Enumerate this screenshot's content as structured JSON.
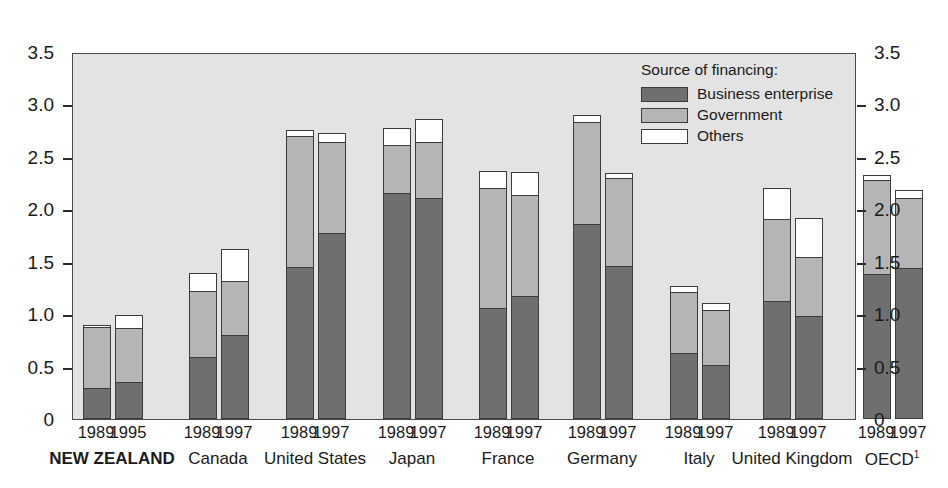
{
  "chart_data": {
    "type": "bar",
    "subtype": "stacked-grouped",
    "title": "",
    "xlabel": "",
    "ylabel": "",
    "ylim": [
      0,
      3.5
    ],
    "yticks": [
      0,
      0.5,
      1.0,
      1.5,
      2.0,
      2.5,
      3.0,
      3.5
    ],
    "ytick_labels": [
      "0",
      "0.5",
      "1.0",
      "1.5",
      "2.0",
      "2.5",
      "3.0",
      "3.5"
    ],
    "grid": false,
    "dual_axis": true,
    "legend": {
      "title": "Source of financing:",
      "position": "top-right-inside",
      "entries": [
        {
          "label": "Business enterprise",
          "key": "business",
          "color": "#6f6f6f"
        },
        {
          "label": "Government",
          "key": "government",
          "color": "#b5b5b5"
        },
        {
          "label": "Others",
          "key": "others",
          "color": "#ffffff"
        }
      ]
    },
    "series": [
      {
        "name": "Business enterprise",
        "key": "business",
        "color": "#6f6f6f"
      },
      {
        "name": "Government",
        "key": "government",
        "color": "#b5b5b5"
      },
      {
        "name": "Others",
        "key": "others",
        "color": "#ffffff"
      }
    ],
    "groups": [
      {
        "country": "NEW ZEALAND",
        "emphasis": true,
        "bars": [
          {
            "year": "1989",
            "business": 0.29,
            "government": 0.58,
            "others": 0.02,
            "total": 0.89
          },
          {
            "year": "1995",
            "business": 0.34,
            "government": 0.52,
            "others": 0.12,
            "total": 0.98
          }
        ]
      },
      {
        "country": "Canada",
        "emphasis": false,
        "bars": [
          {
            "year": "1989",
            "business": 0.58,
            "government": 0.63,
            "others": 0.17,
            "total": 1.38
          },
          {
            "year": "1997",
            "business": 0.79,
            "government": 0.52,
            "others": 0.3,
            "total": 1.61
          }
        ]
      },
      {
        "country": "United States",
        "emphasis": false,
        "bars": [
          {
            "year": "1989",
            "business": 1.44,
            "government": 1.25,
            "others": 0.06,
            "total": 2.75
          },
          {
            "year": "1997",
            "business": 1.76,
            "government": 0.87,
            "others": 0.09,
            "total": 2.72
          }
        ]
      },
      {
        "country": "Japan",
        "emphasis": false,
        "bars": [
          {
            "year": "1989",
            "business": 2.15,
            "government": 0.45,
            "others": 0.17,
            "total": 2.77
          },
          {
            "year": "1997",
            "business": 2.1,
            "government": 0.53,
            "others": 0.22,
            "total": 2.85
          }
        ]
      },
      {
        "country": "France",
        "emphasis": false,
        "bars": [
          {
            "year": "1989",
            "business": 1.05,
            "government": 1.14,
            "others": 0.17,
            "total": 2.36
          },
          {
            "year": "1997",
            "business": 1.16,
            "government": 0.97,
            "others": 0.22,
            "total": 2.35
          }
        ]
      },
      {
        "country": "Germany",
        "emphasis": false,
        "bars": [
          {
            "year": "1989",
            "business": 1.85,
            "government": 0.97,
            "others": 0.07,
            "total": 2.89
          },
          {
            "year": "1997",
            "business": 1.45,
            "government": 0.84,
            "others": 0.05,
            "total": 2.34
          }
        ]
      },
      {
        "country": "Italy",
        "emphasis": false,
        "bars": [
          {
            "year": "1989",
            "business": 0.62,
            "government": 0.58,
            "others": 0.06,
            "total": 1.26
          },
          {
            "year": "1997",
            "business": 0.51,
            "government": 0.52,
            "others": 0.07,
            "total": 1.1
          }
        ]
      },
      {
        "country": "United Kingdom",
        "emphasis": false,
        "bars": [
          {
            "year": "1989",
            "business": 1.12,
            "government": 0.78,
            "others": 0.29,
            "total": 2.19
          },
          {
            "year": "1997",
            "business": 0.97,
            "government": 0.57,
            "others": 0.37,
            "total": 1.91
          }
        ]
      },
      {
        "country": "OECD",
        "country_footnote": "1",
        "emphasis": false,
        "bars": [
          {
            "year": "1989",
            "business": 1.37,
            "government": 0.9,
            "others": 0.05,
            "total": 2.32
          },
          {
            "year": "1997",
            "business": 1.43,
            "government": 0.67,
            "others": 0.07,
            "total": 2.17
          }
        ]
      }
    ]
  }
}
